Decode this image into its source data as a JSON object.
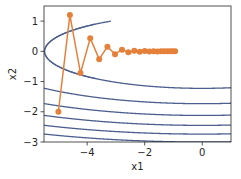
{
  "chart_data": {
    "type": "line",
    "title": "",
    "xlabel": "x1",
    "ylabel": "x2",
    "xlim": [
      -5.5,
      1.0
    ],
    "ylim": [
      -3.0,
      1.5
    ],
    "xticks": [
      -4,
      -2,
      0
    ],
    "xtick_labels": [
      "−4",
      "−2",
      "0"
    ],
    "yticks": [
      1,
      0,
      -1,
      -2,
      -3
    ],
    "ytick_labels": [
      "1",
      "0",
      "−1",
      "−2",
      "−3"
    ],
    "grid": false,
    "legend": null,
    "contour": {
      "function": "0.1*x1^2 + 2*x2^2",
      "x1_range": [
        -5.5,
        1.0
      ],
      "x2_range": [
        -3.0,
        1.0
      ],
      "levels": [
        3,
        6,
        9,
        12,
        15,
        18
      ],
      "color": "#4c5f8f"
    },
    "series": [
      {
        "name": "gradient descent trajectory",
        "color": "#e5803a",
        "marker": "circle",
        "x": [
          -5.0,
          -4.6,
          -4.232,
          -3.8934,
          -3.582,
          -3.2954,
          -3.0318,
          -2.7893,
          -2.5661,
          -2.3608,
          -2.172,
          -1.9982,
          -1.8383,
          -1.6913,
          -1.556,
          -1.4315,
          -1.317,
          -1.2116,
          -1.1147,
          -1.0255,
          -0.9434
        ],
        "y": [
          -2.0,
          1.2,
          -0.72,
          0.432,
          -0.2592,
          0.1555,
          -0.0933,
          0.056,
          -0.0336,
          0.0202,
          -0.0121,
          0.0073,
          -0.0044,
          0.0026,
          -0.0016,
          0.0009,
          -0.0006,
          0.0003,
          -0.0002,
          0.0001,
          -0.0001
        ]
      }
    ]
  },
  "axes": {
    "xlabel": "x1",
    "ylabel": "x2"
  }
}
